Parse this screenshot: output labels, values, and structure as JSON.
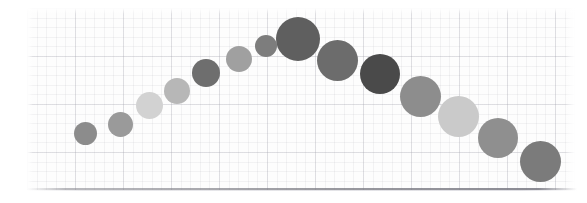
{
  "chart_data": {
    "type": "scatter",
    "title": "",
    "subtitle": "",
    "xlabel": "",
    "ylabel": "",
    "xlim": [
      0,
      587
    ],
    "ylim": [
      0,
      203
    ],
    "grid": true,
    "grid_style": "fine graph paper, minor + major rules",
    "legend": null,
    "legend_position": "none",
    "axis_ticks": [],
    "tick_labels": [],
    "annotations": [],
    "background_color": "#fdfdfd",
    "axis_line_color": "#7a7a82",
    "shape": "inverted-u arc rising then falling left-to-right",
    "marker": "filled circle",
    "point_count": 14,
    "points": [
      {
        "index": 1,
        "cx": 85,
        "cy": 133,
        "r": 11.5,
        "color": "#8c8c8c",
        "size_label": "xs",
        "tone": "mid-gray"
      },
      {
        "index": 2,
        "cx": 120,
        "cy": 124,
        "r": 12.5,
        "color": "#9a9a9a",
        "size_label": "xs",
        "tone": "mid-gray"
      },
      {
        "index": 3,
        "cx": 149,
        "cy": 105,
        "r": 13.5,
        "color": "#d2d2d2",
        "size_label": "s",
        "tone": "light-gray"
      },
      {
        "index": 4,
        "cx": 177,
        "cy": 91,
        "r": 13.0,
        "color": "#b7b7b7",
        "size_label": "s",
        "tone": "light-mid-gray"
      },
      {
        "index": 5,
        "cx": 206,
        "cy": 73,
        "r": 14.0,
        "color": "#6e6e6e",
        "size_label": "s",
        "tone": "dark-gray"
      },
      {
        "index": 6,
        "cx": 239,
        "cy": 59,
        "r": 13.0,
        "color": "#a0a0a0",
        "size_label": "s",
        "tone": "mid-gray"
      },
      {
        "index": 7,
        "cx": 266,
        "cy": 46,
        "r": 11.0,
        "color": "#7d7d7d",
        "size_label": "xs",
        "tone": "dark-gray"
      },
      {
        "index": 8,
        "cx": 298,
        "cy": 39,
        "r": 22.0,
        "color": "#5f5f5f",
        "size_label": "xl",
        "tone": "dark-gray"
      },
      {
        "index": 9,
        "cx": 337,
        "cy": 60,
        "r": 20.5,
        "color": "#6c6c6c",
        "size_label": "l",
        "tone": "dark-gray"
      },
      {
        "index": 10,
        "cx": 380,
        "cy": 74,
        "r": 20.0,
        "color": "#4a4a4a",
        "size_label": "l",
        "tone": "darkest"
      },
      {
        "index": 11,
        "cx": 420,
        "cy": 96,
        "r": 20.5,
        "color": "#8d8d8d",
        "size_label": "l",
        "tone": "mid-gray"
      },
      {
        "index": 12,
        "cx": 458,
        "cy": 116,
        "r": 20.5,
        "color": "#cacaca",
        "size_label": "l",
        "tone": "lightest"
      },
      {
        "index": 13,
        "cx": 498,
        "cy": 138,
        "r": 20.0,
        "color": "#8f8f8f",
        "size_label": "l",
        "tone": "mid-gray"
      },
      {
        "index": 14,
        "cx": 540,
        "cy": 161,
        "r": 20.5,
        "color": "#7b7b7b",
        "size_label": "l",
        "tone": "dark-gray"
      }
    ]
  }
}
